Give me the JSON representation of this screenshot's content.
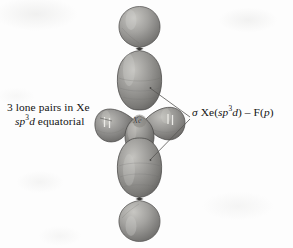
{
  "figure": {
    "background_color": "#fdfdfd",
    "orbital_fill": "#8f8e8c",
    "orbital_shadow": "#5f5e5c",
    "orbital_highlight": "#c2c1bd",
    "line_color": "#555452",
    "text_color": "#131313"
  },
  "center_atom": {
    "symbol": "Xe"
  },
  "left_label": {
    "line1": "3 lone pairs in Xe",
    "line2_italic": "sp",
    "line2_sup": "3",
    "line2_italic2": "d",
    "line2_rest": " equatorial"
  },
  "right_label": {
    "sigma": "σ",
    "part1": " Xe(",
    "italic1": "sp",
    "sup1": "3",
    "italic2": "d",
    "part2": ") – F(",
    "italic3": "p",
    "part3": ")"
  },
  "orbitals": {
    "axial_top_outer": "small teardrop lobe",
    "axial_top_inner": "large elongated lobe",
    "axial_bottom_inner": "large elongated lobe",
    "axial_bottom_outer": "small teardrop lobe",
    "equatorial_lone_pair_left": "lone pair lobe",
    "equatorial_lone_pair_right": "lone pair lobe",
    "equatorial_lone_pair_lower": "lone pair lobe"
  },
  "electron_marks": {
    "count": 3,
    "description": "paired electron tick marks on equatorial lone pair lobes"
  },
  "leader_lines": {
    "left_pointer": "from left label to equatorial lone pair lobes",
    "right_bracket_upper": "from upper axial lobe to right label",
    "right_bracket_lower": "from lower axial lobe to right label"
  }
}
